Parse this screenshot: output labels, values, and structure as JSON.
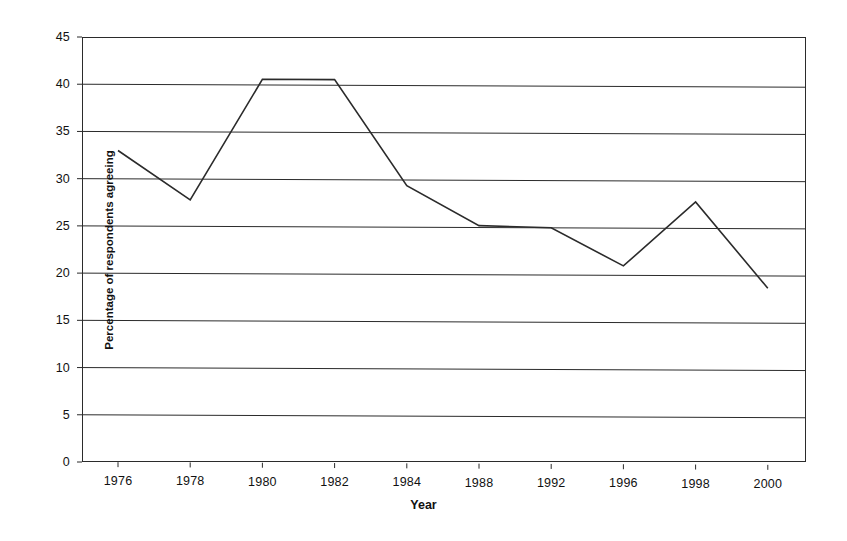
{
  "chart_data": {
    "type": "line",
    "title": "",
    "subtitle": "",
    "xlabel": "Year",
    "ylabel": "Percentage of respondents agreeing",
    "categories": [
      "1976",
      "1978",
      "1980",
      "1982",
      "1984",
      "1988",
      "1992",
      "1996",
      "1998",
      "2000"
    ],
    "values": [
      33.0,
      27.8,
      40.6,
      40.6,
      29.4,
      25.2,
      25.0,
      21.0,
      27.8,
      18.7
    ],
    "series": [
      {
        "name": "Percentage of respondents agreeing",
        "values": [
          33.0,
          27.8,
          40.6,
          40.6,
          29.4,
          25.2,
          25.0,
          21.0,
          27.8,
          18.7
        ]
      }
    ],
    "ylim": [
      0,
      45
    ],
    "ytick_step": 5,
    "yticks": [
      "45",
      "40",
      "35",
      "30",
      "25",
      "20",
      "15",
      "10",
      "5",
      "0"
    ],
    "grid": "horizontal",
    "legend": "none",
    "line_color": "#2b2b2b",
    "frame_color": "#2b2b2b",
    "background": "#ffffff",
    "markers": "none",
    "annotations": []
  },
  "axis": {
    "x_label": "Year",
    "y_label": "Percentage of respondents agreeing"
  }
}
